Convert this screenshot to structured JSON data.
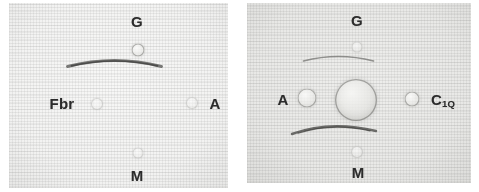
{
  "figure": {
    "background_color": "#ffffff",
    "panel_count": 2
  },
  "panels": [
    {
      "id": "left-plate",
      "name": "left-gel-panel",
      "gel_color": "#f2f2f1",
      "labels": [
        {
          "text": "G",
          "sub": "",
          "name": "label-g",
          "x": 128,
          "y": 18,
          "size": 15
        },
        {
          "text": "Fbr",
          "sub": "",
          "name": "label-fbr",
          "x": 53,
          "y": 100,
          "size": 15
        },
        {
          "text": "A",
          "sub": "",
          "name": "label-a",
          "x": 206,
          "y": 100,
          "size": 15
        },
        {
          "text": "M",
          "sub": "",
          "name": "label-m",
          "x": 128,
          "y": 172,
          "size": 15
        }
      ],
      "wells": [
        {
          "name": "well-g",
          "x": 129,
          "y": 47,
          "d": 13,
          "style": "mid"
        },
        {
          "name": "well-fbr",
          "x": 88,
          "y": 101,
          "d": 12,
          "style": "faint"
        },
        {
          "name": "well-a",
          "x": 183,
          "y": 100,
          "d": 12,
          "style": "faint"
        },
        {
          "name": "well-m",
          "x": 129,
          "y": 150,
          "d": 11,
          "style": "faint"
        }
      ],
      "arcs": [
        {
          "name": "precipitin-arc-upper",
          "x": 130,
          "y": 63,
          "w": 98,
          "h": 13,
          "curve": "convex-up",
          "stroke": "#5a5a58",
          "width": 3.0,
          "opacity": 0.8
        }
      ]
    },
    {
      "id": "right-plate",
      "name": "right-gel-panel",
      "gel_color": "#e8e8e6",
      "labels": [
        {
          "text": "G",
          "sub": "",
          "name": "label-g",
          "x": 357,
          "y": 20,
          "size": 15
        },
        {
          "text": "A",
          "sub": "",
          "name": "label-a",
          "x": 283,
          "y": 99,
          "size": 15
        },
        {
          "text": "C",
          "sub": "1Q",
          "name": "label-c1q",
          "x": 443,
          "y": 99,
          "size": 15
        },
        {
          "text": "M",
          "sub": "",
          "name": "label-m",
          "x": 358,
          "y": 172,
          "size": 15
        }
      ],
      "wells": [
        {
          "name": "well-center",
          "x": 356,
          "y": 100,
          "d": 42,
          "style": "big"
        },
        {
          "name": "well-g",
          "x": 357,
          "y": 47,
          "d": 11,
          "style": "faint"
        },
        {
          "name": "well-a",
          "x": 307,
          "y": 98,
          "d": 19,
          "style": "mid"
        },
        {
          "name": "well-c1q",
          "x": 412,
          "y": 99,
          "d": 15,
          "style": "mid"
        },
        {
          "name": "well-m",
          "x": 357,
          "y": 152,
          "d": 12,
          "style": "faint"
        }
      ],
      "arcs": [
        {
          "name": "precipitin-arc-upper",
          "x": 357,
          "y": 61,
          "w": 74,
          "h": 11,
          "curve": "convex-up",
          "stroke": "#6b6b68",
          "width": 1.7,
          "opacity": 0.7
        },
        {
          "name": "precipitin-arc-lower",
          "x": 356,
          "y": 133,
          "w": 86,
          "h": 14,
          "curve": "convex-up",
          "stroke": "#4f4f4d",
          "width": 2.4,
          "opacity": 0.82
        }
      ]
    }
  ]
}
